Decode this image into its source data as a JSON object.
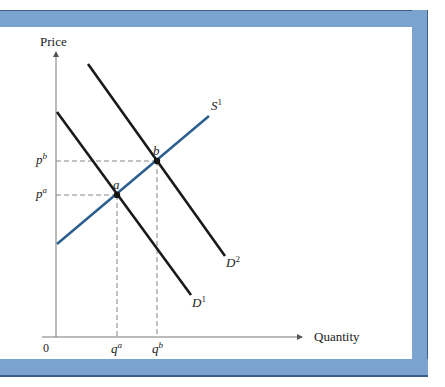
{
  "diagram": {
    "type": "supply-demand",
    "axes": {
      "y_label": "Price",
      "x_label": "Quantity",
      "origin_label": "0"
    },
    "curves": [
      {
        "id": "S1",
        "label": "S",
        "superscript": "1",
        "kind": "supply",
        "color": "#2c5f8f",
        "from": [
          57,
          244
        ],
        "to": [
          209,
          116
        ]
      },
      {
        "id": "D1",
        "label": "D",
        "superscript": "1",
        "kind": "demand",
        "color": "#1a1a1a",
        "from": [
          57,
          112
        ],
        "to": [
          191,
          295
        ]
      },
      {
        "id": "D2",
        "label": "D",
        "superscript": "2",
        "kind": "demand",
        "color": "#1a1a1a",
        "from": [
          88,
          64
        ],
        "to": [
          225,
          256
        ]
      }
    ],
    "points": [
      {
        "id": "a",
        "label": "a",
        "x": 117,
        "y": 195,
        "price_label": "p",
        "price_sup": "a",
        "qty_label": "q",
        "qty_sup": "a"
      },
      {
        "id": "b",
        "label": "b",
        "x": 157,
        "y": 161,
        "price_label": "p",
        "price_sup": "b",
        "qty_label": "q",
        "qty_sup": "b"
      }
    ],
    "frame_color": "#7ba3cf",
    "frame_border_color": "#3d5f86"
  }
}
